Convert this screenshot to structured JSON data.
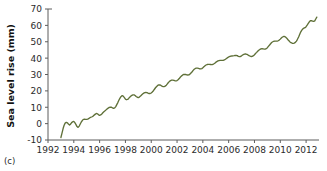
{
  "panel": {
    "id": "(c)"
  },
  "chart_data": {
    "type": "line",
    "title": "",
    "xlabel": "",
    "ylabel": "Sea level rise (mm)",
    "grid": false,
    "legend": null,
    "line_color": "#5f7038",
    "axis_color": "#5d5d5d",
    "xlim": [
      1992,
      2013
    ],
    "ylim": [
      -10,
      70
    ],
    "xticks": [
      1992,
      1994,
      1996,
      1998,
      2000,
      2002,
      2004,
      2006,
      2008,
      2010,
      2012
    ],
    "xticklabels": [
      "1992",
      "1994",
      "1996",
      "1998",
      "2000",
      "2002",
      "2004",
      "2006",
      "2008",
      "2010",
      "2012"
    ],
    "yticks": [
      -10,
      0,
      10,
      20,
      30,
      40,
      50,
      60,
      70
    ],
    "yticklabels": [
      "-10",
      "0",
      "10",
      "20",
      "30",
      "40",
      "50",
      "60",
      "70"
    ],
    "series": [
      {
        "name": "Global mean sea level rise",
        "units": "mm",
        "x": [
          1993.0,
          1993.08,
          1993.17,
          1993.25,
          1993.33,
          1993.42,
          1993.5,
          1993.58,
          1993.67,
          1993.75,
          1993.83,
          1993.92,
          1994.0,
          1994.08,
          1994.17,
          1994.25,
          1994.33,
          1994.42,
          1994.5,
          1994.58,
          1994.67,
          1994.75,
          1994.83,
          1994.92,
          1995.0,
          1995.08,
          1995.17,
          1995.25,
          1995.33,
          1995.42,
          1995.5,
          1995.58,
          1995.67,
          1995.75,
          1995.83,
          1995.92,
          1996.0,
          1996.08,
          1996.17,
          1996.25,
          1996.33,
          1996.42,
          1996.5,
          1996.58,
          1996.67,
          1996.75,
          1996.83,
          1996.92,
          1997.0,
          1997.08,
          1997.17,
          1997.25,
          1997.33,
          1997.42,
          1997.5,
          1997.58,
          1997.67,
          1997.75,
          1997.83,
          1997.92,
          1998.0,
          1998.08,
          1998.17,
          1998.25,
          1998.33,
          1998.42,
          1998.5,
          1998.58,
          1998.67,
          1998.75,
          1998.83,
          1998.92,
          1999.0,
          1999.08,
          1999.17,
          1999.25,
          1999.33,
          1999.42,
          1999.5,
          1999.58,
          1999.67,
          1999.75,
          1999.83,
          1999.92,
          2000.0,
          2000.08,
          2000.17,
          2000.25,
          2000.33,
          2000.42,
          2000.5,
          2000.58,
          2000.67,
          2000.75,
          2000.83,
          2000.92,
          2001.0,
          2001.08,
          2001.17,
          2001.25,
          2001.33,
          2001.42,
          2001.5,
          2001.58,
          2001.67,
          2001.75,
          2001.83,
          2001.92,
          2002.0,
          2002.08,
          2002.17,
          2002.25,
          2002.33,
          2002.42,
          2002.5,
          2002.58,
          2002.67,
          2002.75,
          2002.83,
          2002.92,
          2003.0,
          2003.08,
          2003.17,
          2003.25,
          2003.33,
          2003.42,
          2003.5,
          2003.58,
          2003.67,
          2003.75,
          2003.83,
          2003.92,
          2004.0,
          2004.08,
          2004.17,
          2004.25,
          2004.33,
          2004.42,
          2004.5,
          2004.58,
          2004.67,
          2004.75,
          2004.83,
          2004.92,
          2005.0,
          2005.08,
          2005.17,
          2005.25,
          2005.33,
          2005.42,
          2005.5,
          2005.58,
          2005.67,
          2005.75,
          2005.83,
          2005.92,
          2006.0,
          2006.08,
          2006.17,
          2006.25,
          2006.33,
          2006.42,
          2006.5,
          2006.58,
          2006.67,
          2006.75,
          2006.83,
          2006.92,
          2007.0,
          2007.08,
          2007.17,
          2007.25,
          2007.33,
          2007.42,
          2007.5,
          2007.58,
          2007.67,
          2007.75,
          2007.83,
          2007.92,
          2008.0,
          2008.08,
          2008.17,
          2008.25,
          2008.33,
          2008.42,
          2008.5,
          2008.58,
          2008.67,
          2008.75,
          2008.83,
          2008.92,
          2009.0,
          2009.08,
          2009.17,
          2009.25,
          2009.33,
          2009.42,
          2009.5,
          2009.58,
          2009.67,
          2009.75,
          2009.83,
          2009.92,
          2010.0,
          2010.08,
          2010.17,
          2010.25,
          2010.33,
          2010.42,
          2010.5,
          2010.58,
          2010.67,
          2010.75,
          2010.83,
          2010.92,
          2011.0,
          2011.08,
          2011.17,
          2011.25,
          2011.33,
          2011.42,
          2011.5,
          2011.58,
          2011.67,
          2011.75,
          2011.83,
          2011.92,
          2012.0,
          2012.08,
          2012.17,
          2012.25,
          2012.33,
          2012.42,
          2012.5,
          2012.58,
          2012.67,
          2012.75,
          2012.83
        ],
        "y": [
          -8.5,
          -6.0,
          -3.0,
          -1.0,
          0.3,
          0.8,
          0.5,
          -0.2,
          -0.8,
          -0.3,
          0.6,
          1.2,
          1.3,
          0.6,
          -0.6,
          -1.8,
          -2.3,
          -1.5,
          -0.2,
          1.0,
          2.0,
          2.6,
          2.7,
          2.6,
          2.6,
          2.8,
          3.2,
          3.6,
          3.9,
          4.2,
          4.6,
          5.2,
          5.8,
          6.2,
          6.0,
          5.4,
          5.1,
          5.3,
          5.9,
          6.6,
          7.2,
          7.8,
          8.4,
          9.0,
          9.5,
          9.9,
          10.1,
          10.0,
          9.6,
          9.3,
          9.6,
          10.4,
          11.6,
          13.0,
          14.4,
          15.6,
          16.6,
          17.1,
          16.8,
          15.9,
          15.0,
          14.6,
          14.8,
          15.4,
          16.1,
          16.8,
          17.3,
          17.6,
          17.6,
          17.2,
          16.6,
          16.1,
          15.9,
          16.2,
          16.8,
          17.5,
          18.1,
          18.6,
          18.9,
          19.0,
          18.9,
          18.6,
          18.4,
          18.4,
          18.7,
          19.3,
          20.1,
          21.0,
          21.9,
          22.7,
          23.3,
          23.6,
          23.6,
          23.3,
          22.9,
          22.6,
          22.6,
          22.9,
          23.5,
          24.3,
          25.1,
          25.8,
          26.3,
          26.6,
          26.6,
          26.4,
          26.2,
          26.1,
          26.3,
          26.8,
          27.5,
          28.3,
          29.0,
          29.6,
          30.0,
          30.1,
          30.0,
          29.8,
          29.7,
          29.8,
          30.2,
          30.9,
          31.7,
          32.5,
          33.2,
          33.7,
          33.9,
          33.9,
          33.7,
          33.5,
          33.4,
          33.6,
          34.1,
          34.7,
          35.3,
          35.8,
          36.1,
          36.2,
          36.2,
          36.1,
          36.0,
          36.1,
          36.4,
          36.9,
          37.4,
          37.9,
          38.3,
          38.5,
          38.6,
          38.6,
          38.6,
          38.7,
          38.9,
          39.3,
          39.8,
          40.3,
          40.7,
          41.0,
          41.2,
          41.3,
          41.4,
          41.5,
          41.6,
          41.7,
          41.5,
          41.1,
          40.9,
          41.0,
          41.4,
          41.9,
          42.3,
          42.5,
          42.5,
          42.3,
          41.9,
          41.5,
          41.2,
          41.0,
          41.1,
          41.5,
          42.1,
          42.8,
          43.5,
          44.2,
          44.8,
          45.3,
          45.6,
          45.7,
          45.6,
          45.5,
          45.5,
          45.8,
          46.4,
          47.2,
          48.0,
          48.8,
          49.5,
          50.0,
          50.3,
          50.4,
          50.4,
          50.4,
          50.6,
          51.0,
          51.6,
          52.3,
          52.9,
          53.2,
          53.2,
          52.8,
          52.2,
          51.4,
          50.6,
          49.9,
          49.4,
          49.1,
          49.0,
          49.2,
          49.6,
          50.4,
          51.5,
          52.9,
          54.4,
          55.9,
          57.1,
          57.9,
          58.3,
          58.6,
          59.2,
          60.1,
          61.2,
          62.2,
          62.8,
          62.9,
          62.6,
          62.4,
          62.8,
          63.9,
          65.0
        ]
      }
    ]
  }
}
